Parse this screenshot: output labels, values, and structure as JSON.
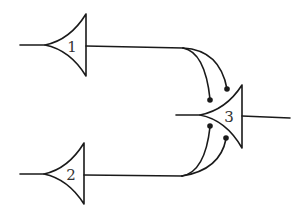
{
  "diagram": {
    "type": "neural-circuit",
    "neurons": [
      {
        "id": "1",
        "label": "1"
      },
      {
        "id": "2",
        "label": "2"
      },
      {
        "id": "3",
        "label": "3"
      }
    ],
    "connections": [
      {
        "from": "1",
        "to": "3",
        "synapses": 2
      },
      {
        "from": "2",
        "to": "3",
        "synapses": 2
      }
    ],
    "colors": {
      "line": "#1a1a1a",
      "label": "#333333",
      "background": "#ffffff"
    }
  }
}
